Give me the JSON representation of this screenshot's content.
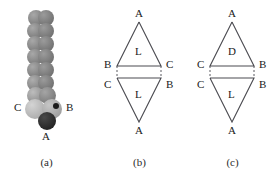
{
  "figure": {
    "panels": [
      {
        "id": "a",
        "caption": "(a)",
        "type": "sphere-chain-model",
        "labels": {
          "left": "C",
          "right": "B",
          "bottom": "A"
        },
        "colors": {
          "chain_sphere": "#8c8c8c",
          "chain_sphere_dark": "#6e6e6e",
          "terminal_sphere_light": "#b9b9b9",
          "terminal_sphere_dark": "#2a2a2a"
        }
      },
      {
        "id": "b",
        "caption": "(b)",
        "type": "triangle-pair-diagram",
        "top_triangle": {
          "apex": "A",
          "left": "B",
          "right": "C",
          "inner": "L"
        },
        "bottom_triangle": {
          "apex": "A",
          "left": "C",
          "right": "B",
          "inner": "L"
        }
      },
      {
        "id": "c",
        "caption": "(c)",
        "type": "triangle-pair-diagram",
        "top_triangle": {
          "apex": "A",
          "left": "C",
          "right": "B",
          "inner": "D"
        },
        "bottom_triangle": {
          "apex": "A",
          "left": "C",
          "right": "B",
          "inner": "L"
        }
      }
    ]
  }
}
